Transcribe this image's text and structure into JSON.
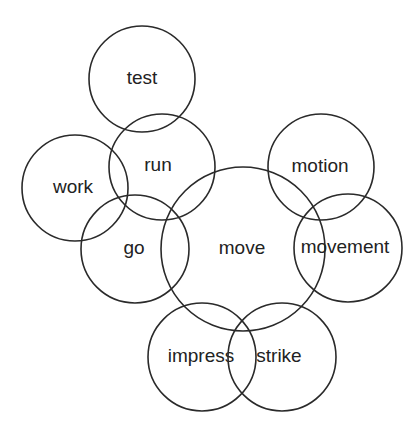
{
  "diagram": {
    "type": "word-association-circles",
    "nodes": [
      {
        "id": "test",
        "label": "test",
        "cx": 142,
        "cy": 79,
        "r": 53
      },
      {
        "id": "work",
        "label": "work",
        "cx": 75,
        "cy": 188,
        "r": 53
      },
      {
        "id": "run",
        "label": "run",
        "cx": 162,
        "cy": 167,
        "r": 53
      },
      {
        "id": "go",
        "label": "go",
        "cx": 135,
        "cy": 249,
        "r": 54
      },
      {
        "id": "move",
        "label": "move",
        "cx": 243,
        "cy": 249,
        "r": 82
      },
      {
        "id": "motion",
        "label": "motion",
        "cx": 321,
        "cy": 167,
        "r": 53
      },
      {
        "id": "movement",
        "label": "movement",
        "cx": 348,
        "cy": 248,
        "r": 54
      },
      {
        "id": "impress",
        "label": "impress",
        "cx": 202,
        "cy": 357,
        "r": 54
      },
      {
        "id": "strike",
        "label": "strike",
        "cx": 282,
        "cy": 357,
        "r": 54
      }
    ]
  }
}
